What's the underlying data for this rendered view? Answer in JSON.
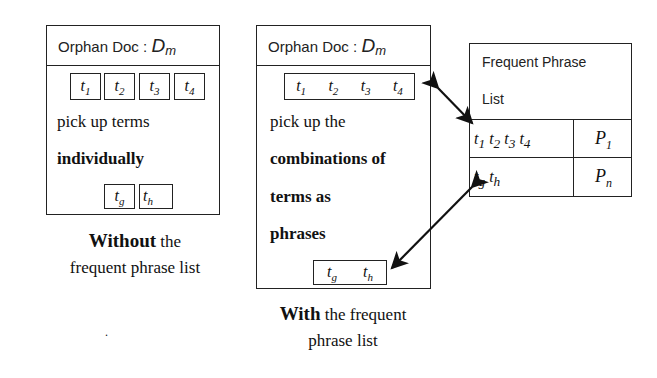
{
  "left_panel": {
    "header_prefix": "Orphan Doc : ",
    "header_symbol": "D",
    "header_symbol_sub": "m",
    "terms": [
      {
        "base": "t",
        "sub": "1"
      },
      {
        "base": "t",
        "sub": "2"
      },
      {
        "base": "t",
        "sub": "3"
      },
      {
        "base": "t",
        "sub": "4"
      }
    ],
    "text_line1": "pick up terms",
    "text_line2": "individually",
    "bottom_terms": [
      {
        "base": "t",
        "sub": "g"
      },
      {
        "base": "t",
        "sub": "h"
      }
    ],
    "caption_bold": "Without",
    "caption_rest": " the",
    "caption_line2": "frequent phrase list"
  },
  "middle_panel": {
    "header_prefix": "Orphan Doc : ",
    "header_symbol": "D",
    "header_symbol_sub": "m",
    "terms": [
      {
        "base": "t",
        "sub": "1"
      },
      {
        "base": "t",
        "sub": "2"
      },
      {
        "base": "t",
        "sub": "3"
      },
      {
        "base": "t",
        "sub": "4"
      }
    ],
    "text_line1": "pick up the",
    "text_line2": "combinations of",
    "text_line3": "terms as",
    "text_line4": "phrases",
    "bottom_terms": [
      {
        "base": "t",
        "sub": "g"
      },
      {
        "base": "t",
        "sub": "h"
      }
    ],
    "caption_bold": "With",
    "caption_rest": " the frequent",
    "caption_line2": "phrase list"
  },
  "phrase_list": {
    "title_line1": "Frequent Phrase",
    "title_line2": "List",
    "rows": [
      {
        "terms": [
          {
            "base": "t",
            "sub": "1"
          },
          {
            "base": "t",
            "sub": "2"
          },
          {
            "base": "t",
            "sub": "3"
          },
          {
            "base": "t",
            "sub": "4"
          }
        ],
        "id_base": "P",
        "id_sub": "1"
      },
      {
        "terms": [
          {
            "base": "t",
            "sub": "g"
          },
          {
            "base": "t",
            "sub": "h"
          }
        ],
        "id_base": "P",
        "id_sub": "n"
      }
    ]
  },
  "stray_mark": "."
}
